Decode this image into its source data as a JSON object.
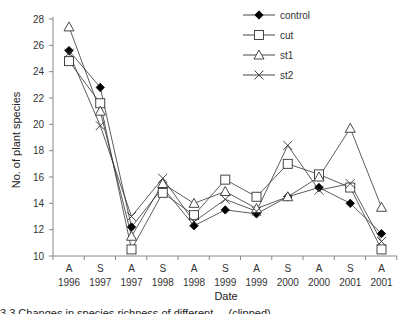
{
  "chart_data": {
    "type": "line",
    "title": "",
    "xlabel": "Date",
    "ylabel": "No. of plant species",
    "ylim": [
      10,
      28
    ],
    "yticks": [
      10,
      12,
      14,
      16,
      18,
      20,
      22,
      24,
      26,
      28
    ],
    "grid": false,
    "legend_position": "top-right",
    "categories": [
      {
        "season": "A",
        "year": "1996"
      },
      {
        "season": "S",
        "year": "1997"
      },
      {
        "season": "A",
        "year": "1997"
      },
      {
        "season": "S",
        "year": "1998"
      },
      {
        "season": "A",
        "year": "1998"
      },
      {
        "season": "S",
        "year": "1999"
      },
      {
        "season": "A",
        "year": "1999"
      },
      {
        "season": "S",
        "year": "2000"
      },
      {
        "season": "A",
        "year": "2000"
      },
      {
        "season": "S",
        "year": "2001"
      },
      {
        "season": "A",
        "year": "2001"
      }
    ],
    "series": [
      {
        "name": "control",
        "marker": "filled-diamond",
        "values": [
          25.6,
          22.8,
          12.2,
          15.2,
          12.3,
          13.5,
          13.2,
          14.5,
          15.2,
          14.0,
          11.7
        ]
      },
      {
        "name": "cut",
        "marker": "open-square",
        "values": [
          24.8,
          21.6,
          10.5,
          14.8,
          13.1,
          15.8,
          14.5,
          17.0,
          16.2,
          15.2,
          10.5
        ]
      },
      {
        "name": "st1",
        "marker": "open-triangle",
        "values": [
          27.4,
          21.0,
          11.5,
          15.5,
          14.0,
          14.9,
          13.6,
          14.5,
          16.0,
          19.7,
          13.7
        ]
      },
      {
        "name": "st2",
        "marker": "x-cross",
        "values": [
          25.4,
          19.9,
          13.0,
          15.9,
          12.6,
          14.3,
          13.4,
          18.4,
          15.0,
          15.5,
          11.1
        ]
      }
    ]
  },
  "caption": "3.3  Changes in species richness of different ... (clipped)"
}
